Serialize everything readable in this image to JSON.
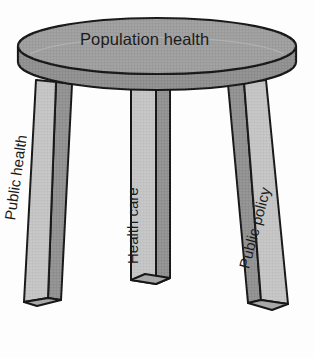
{
  "diagram": {
    "type": "three-legged-stool",
    "seat": {
      "label": "Population health"
    },
    "legs": [
      {
        "id": "left",
        "label": "Public health"
      },
      {
        "id": "middle",
        "label": "Health care"
      },
      {
        "id": "right",
        "label": "Public policy"
      }
    ]
  },
  "colors": {
    "background": "#fdfdfd",
    "outline": "#171717",
    "seat_top": "#9c9c9c",
    "seat_rim": "#8d8d8d",
    "leg_face": "#c3c3c3",
    "leg_side": "#8f8f8f",
    "leg_bottom": "#a8a8a8",
    "text": "#1b1b1b"
  }
}
